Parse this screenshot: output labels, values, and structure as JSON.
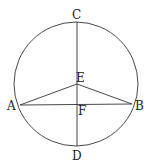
{
  "diagram": {
    "labels": {
      "C": "C",
      "E": "E",
      "A": "A",
      "F": "F",
      "B": "B",
      "D": "D"
    },
    "colors": {
      "stroke": "#333333",
      "background": "#ffffff"
    }
  }
}
